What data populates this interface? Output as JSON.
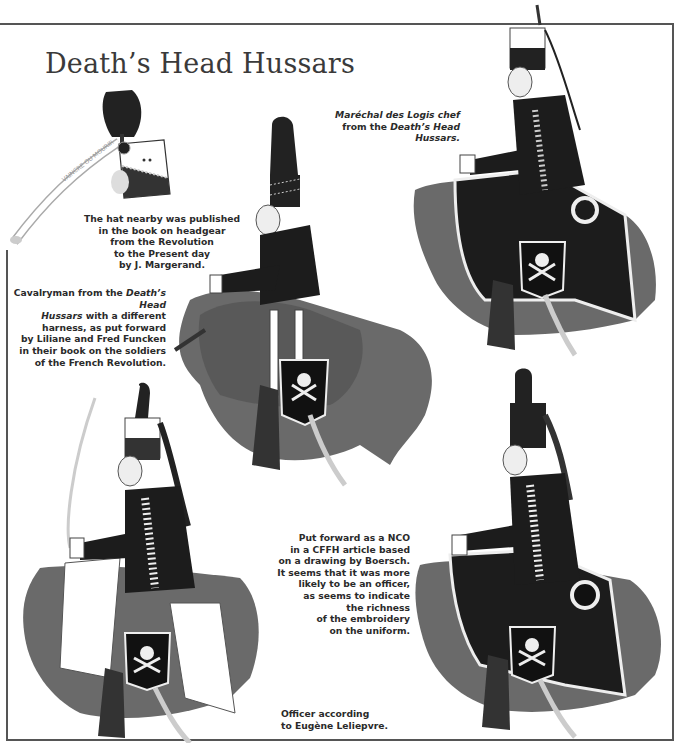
{
  "page": {
    "title": "Death’s Head Hussars"
  },
  "captions": {
    "hat": {
      "lines": [
        "The hat nearby was published",
        "in the book on headgear",
        "from the Revolution",
        "to the Present day",
        "by J. Margerand."
      ]
    },
    "cavalryman": {
      "line1_prefix": "Cavalryman from the ",
      "line1_italic": "Death’s Head",
      "line2_italic": "Hussars",
      "line2_suffix": " with a different",
      "lines": [
        "harness, as put forward",
        "by Liliane and Fred Funcken",
        "in their book on the soldiers",
        "of the French Revolution."
      ]
    },
    "marechal": {
      "line1": "Maréchal des Logis chef",
      "line2_prefix": "from the ",
      "line2_italic": "Death’s Head",
      "line3": "Hussars."
    },
    "nco": {
      "lines": [
        "Put forward as a NCO",
        "in a CFFH article based",
        "on a drawing by Boersch.",
        "It seems that it was more",
        "likely to be an officer,",
        "as seems to indicate",
        "the richness",
        "of the embroidery",
        "on the uniform."
      ]
    },
    "officer": {
      "lines": [
        "Officer according",
        "to Eugène Leliepvre."
      ]
    }
  },
  "illustrations": {
    "hat_ribbon_text": "VAINCRE OU MOURIR",
    "figures": [
      "shako-hat",
      "cavalryman-funcken",
      "marechal-des-logis-chef",
      "officer-leliepvre",
      "nco-boersch"
    ]
  },
  "colors": {
    "ink": "#2a2a2a",
    "horse": "#6e6e6e",
    "uniform": "#1c1c1c",
    "rule": "#555555"
  }
}
